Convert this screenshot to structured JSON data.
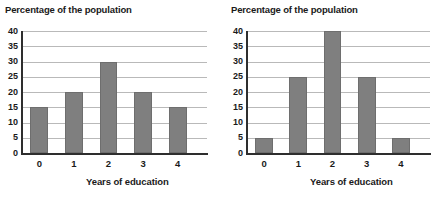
{
  "figure": {
    "background": "#ffffff",
    "bar_color": "#7f7f7f",
    "gridline_color": "#b9b9b9",
    "axis_color": "#2e2e2e",
    "text_color": "#1a1a1a"
  },
  "chart_data": [
    {
      "type": "bar",
      "title": "Percentage of the population",
      "xlabel": "Years of education",
      "ylabel": "",
      "categories": [
        "0",
        "1",
        "2",
        "3",
        "4"
      ],
      "values": [
        15,
        20,
        30,
        20,
        15
      ],
      "ylim": [
        0,
        40
      ],
      "yticks": [
        40,
        35,
        30,
        25,
        20,
        15,
        10,
        5,
        0
      ],
      "grid": true,
      "legend": false
    },
    {
      "type": "bar",
      "title": "Percentage of the population",
      "xlabel": "Years of education",
      "ylabel": "",
      "categories": [
        "0",
        "1",
        "2",
        "3",
        "4"
      ],
      "values": [
        5,
        25,
        40,
        25,
        5
      ],
      "ylim": [
        0,
        40
      ],
      "yticks": [
        40,
        35,
        30,
        25,
        20,
        15,
        10,
        5,
        0
      ],
      "grid": true,
      "legend": false
    }
  ]
}
